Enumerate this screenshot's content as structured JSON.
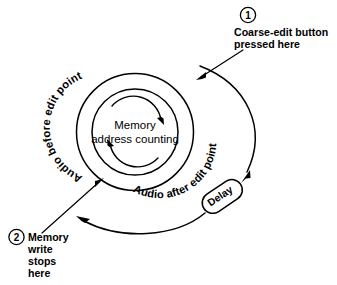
{
  "diagram": {
    "background_color": "#ffffff",
    "line_color": "#000000",
    "center": {
      "line1": "Memory",
      "line2": "address counting"
    },
    "ring_labels": {
      "before": "Audio before edit point",
      "after": "Audio after edit point"
    },
    "delay_block": {
      "label": "Delay"
    },
    "callouts": [
      {
        "marker": "1",
        "line1": "Coarse-edit button",
        "line2": "pressed here"
      },
      {
        "marker": "2",
        "line1": "Memory",
        "line2": "write",
        "line3": "stops",
        "line4": "here"
      }
    ],
    "icons": {
      "rotation_arrow_top": "clockwise-arrow-icon",
      "rotation_arrow_bottom": "clockwise-arrow-icon",
      "callout1_arrow": "arrow-icon",
      "callout2_arrow": "arrow-icon",
      "delay_in_arrow": "arrow-icon",
      "feedback_arrow": "arrow-icon"
    }
  }
}
